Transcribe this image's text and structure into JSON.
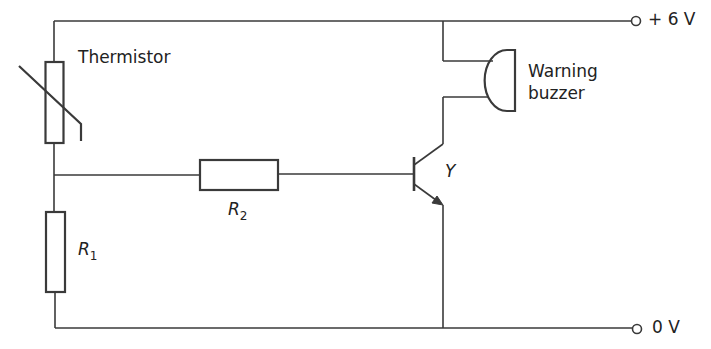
{
  "diagram": {
    "type": "circuit",
    "labels": {
      "thermistor": "Thermistor",
      "buzzer_line1": "Warning",
      "buzzer_line2": "buzzer",
      "transistor": "Y",
      "r1_main": "R",
      "r1_sub": "1",
      "r2_main": "R",
      "r2_sub": "2",
      "supply_positive": "+ 6 V",
      "supply_ground": "0 V"
    },
    "components": [
      {
        "id": "thermistor",
        "kind": "thermistor"
      },
      {
        "id": "R1",
        "kind": "resistor"
      },
      {
        "id": "R2",
        "kind": "resistor"
      },
      {
        "id": "Y",
        "kind": "npn-transistor"
      },
      {
        "id": "buzzer",
        "kind": "buzzer"
      }
    ],
    "colors": {
      "line": "#3a3a3a",
      "text": "#222222"
    }
  }
}
